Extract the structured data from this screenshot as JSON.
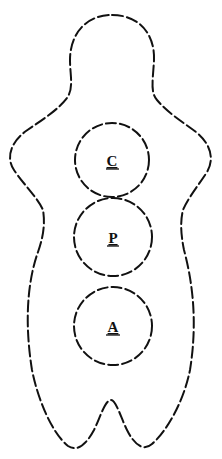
{
  "diagram": {
    "title": "",
    "figure": "human-body-silhouette",
    "regions": [
      {
        "id": "C",
        "label": "C",
        "cx": 112,
        "cy": 160,
        "r": 37
      },
      {
        "id": "P",
        "label": "P",
        "cx": 113,
        "cy": 237,
        "r": 39
      },
      {
        "id": "A",
        "label": "A",
        "cx": 113,
        "cy": 326,
        "r": 39
      }
    ],
    "colors": {
      "stroke": "#111111",
      "background": "#ffffff"
    }
  }
}
